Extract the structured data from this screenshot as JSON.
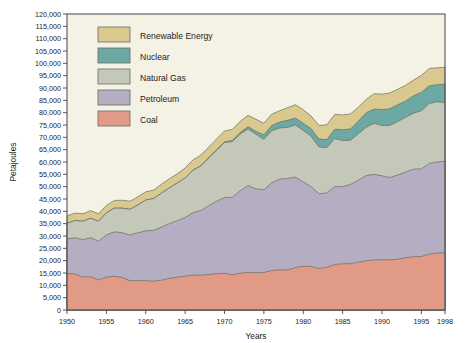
{
  "chart_data": {
    "type": "area",
    "stacked": true,
    "title": "",
    "xlabel": "Years",
    "ylabel": "Petajoules",
    "xlim": [
      1950,
      1998
    ],
    "ylim": [
      0,
      120000
    ],
    "ytick_step": 5000,
    "grid": false,
    "legend_position": "upper-left-inside",
    "x_tick_labels": [
      "1950",
      "1955",
      "1960",
      "1965",
      "1970",
      "1975",
      "1980",
      "1985",
      "1990",
      "1995",
      "1998"
    ],
    "y_tick_labels": [
      "0",
      "5,000",
      "10,000",
      "15,000",
      "20,000",
      "25,000",
      "30,000",
      "35,000",
      "40,000",
      "45,000",
      "50,000",
      "55,000",
      "60,000",
      "65,000",
      "70,000",
      "75,000",
      "80,000",
      "85,000",
      "90,000",
      "95,000",
      "100,000",
      "105,000",
      "110,000",
      "115,000",
      "120,000"
    ],
    "x": [
      1950,
      1951,
      1952,
      1953,
      1954,
      1955,
      1956,
      1957,
      1958,
      1959,
      1960,
      1961,
      1962,
      1963,
      1964,
      1965,
      1966,
      1967,
      1968,
      1969,
      1970,
      1971,
      1972,
      1973,
      1974,
      1975,
      1976,
      1977,
      1978,
      1979,
      1980,
      1981,
      1982,
      1983,
      1984,
      1985,
      1986,
      1987,
      1988,
      1989,
      1990,
      1991,
      1992,
      1993,
      1994,
      1995,
      1996,
      1997,
      1998
    ],
    "series": [
      {
        "name": "Coal",
        "color": "#e09a85",
        "values": [
          14800,
          14600,
          13400,
          13500,
          12200,
          13300,
          13700,
          13200,
          11900,
          11900,
          11900,
          11700,
          12100,
          12800,
          13300,
          13700,
          14200,
          14100,
          14400,
          14700,
          14900,
          14300,
          14900,
          15300,
          15100,
          15200,
          16000,
          16300,
          16200,
          17200,
          17700,
          17700,
          16800,
          17300,
          18500,
          18700,
          18800,
          19400,
          20000,
          20300,
          20400,
          20300,
          20600,
          21200,
          21600,
          21700,
          22700,
          23100,
          23200
        ]
      },
      {
        "name": "Petroleum",
        "color": "#b5aec2",
        "values": [
          14000,
          14700,
          15100,
          15800,
          15700,
          17100,
          18000,
          18100,
          18500,
          19400,
          20200,
          20600,
          21500,
          22200,
          22900,
          23800,
          25300,
          26200,
          27900,
          29400,
          30700,
          31400,
          33500,
          35100,
          34000,
          33500,
          35600,
          36800,
          37100,
          36700,
          34200,
          32300,
          30300,
          30200,
          31500,
          31300,
          32100,
          33200,
          34500,
          34700,
          34000,
          33400,
          34100,
          34700,
          35500,
          35500,
          36700,
          36900,
          37100
        ]
      },
      {
        "name": "Natural Gas",
        "color": "#c3c8b8",
        "values": [
          6300,
          7000,
          7500,
          7900,
          8100,
          9000,
          9600,
          10000,
          10400,
          11300,
          12500,
          12900,
          13800,
          14500,
          15300,
          16000,
          17200,
          18100,
          19300,
          20700,
          22300,
          22600,
          23000,
          23000,
          22100,
          20500,
          21100,
          20700,
          20700,
          21100,
          20900,
          20400,
          19000,
          18300,
          19500,
          18700,
          17900,
          18900,
          19600,
          20700,
          20400,
          21100,
          21700,
          22200,
          22700,
          23600,
          24300,
          24400,
          23800
        ]
      },
      {
        "name": "Nuclear",
        "color": "#6ca8a4",
        "values": [
          0,
          0,
          0,
          0,
          0,
          0,
          0,
          0,
          0,
          0,
          0,
          0,
          0,
          0,
          0,
          40,
          60,
          90,
          130,
          160,
          240,
          420,
          600,
          920,
          1200,
          1800,
          2100,
          2400,
          2900,
          2800,
          2900,
          3100,
          3200,
          3300,
          3800,
          4400,
          4600,
          5100,
          5900,
          5800,
          6400,
          6800,
          6800,
          6600,
          7100,
          7400,
          7200,
          6900,
          7500
        ]
      },
      {
        "name": "Renewable Energy",
        "color": "#d9c98e",
        "values": [
          3000,
          3000,
          3000,
          3100,
          3000,
          3000,
          3100,
          3200,
          3300,
          3300,
          3300,
          3400,
          3600,
          3700,
          3700,
          4000,
          4100,
          4300,
          4300,
          4400,
          4400,
          4500,
          4500,
          4600,
          4900,
          4700,
          4600,
          4600,
          5100,
          5400,
          5500,
          5100,
          5500,
          6000,
          6000,
          6000,
          6100,
          5600,
          5400,
          6200,
          6300,
          6400,
          6300,
          6400,
          6300,
          6900,
          7000,
          6900,
          6800
        ]
      }
    ]
  },
  "legend": {
    "items": [
      {
        "label": "Renewable Energy",
        "color": "#d9c98e"
      },
      {
        "label": "Nuclear",
        "color": "#6ca8a4"
      },
      {
        "label": "Natural Gas",
        "color": "#c3c8b8"
      },
      {
        "label": "Petroleum",
        "color": "#b5aec2"
      },
      {
        "label": "Coal",
        "color": "#e09a85"
      }
    ]
  },
  "colors": {
    "plot_background": "#f4f2e4",
    "page_background": "#ffffff",
    "axis": "#555555",
    "text": "#1d1d1d"
  }
}
